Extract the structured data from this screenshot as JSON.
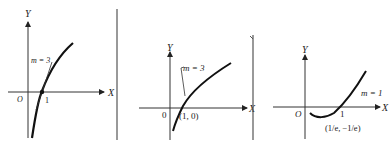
{
  "figure": {
    "panels": [
      {
        "id": "a",
        "y_label": "Y",
        "x_label": "X",
        "origin_label": "O",
        "tick_label": "1",
        "slope_label": "m = 3"
      },
      {
        "id": "b",
        "y_label": "Y",
        "x_label": "X",
        "origin_label": "0",
        "point_label": "(1, 0)",
        "slope_label": "m = 3"
      },
      {
        "id": "c",
        "y_label": "Y",
        "x_label": "X",
        "origin_label": "O",
        "tick_label": "1",
        "slope_label": "m = 1",
        "point_label": "(1/e, −1/e)"
      }
    ],
    "colors": {
      "ink": "#222222",
      "divider": "#555555"
    }
  }
}
